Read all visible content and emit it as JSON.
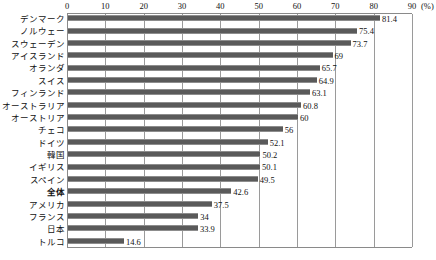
{
  "chart_data": {
    "type": "bar",
    "orientation": "horizontal",
    "title": "",
    "xlabel": "",
    "ylabel": "",
    "unit_label": "(%)",
    "xlim": [
      0,
      90
    ],
    "xticks": [
      0,
      10,
      20,
      30,
      40,
      50,
      60,
      70,
      80,
      90
    ],
    "xtick_labels": [
      "0",
      "10",
      "20",
      "30",
      "40",
      "50",
      "60",
      "70",
      "80",
      "90"
    ],
    "grid": true,
    "grid_axis": "x",
    "legend": false,
    "bar_color": "#5a5a5a",
    "categories": [
      "デンマーク",
      "ノルウェー",
      "スウェーデン",
      "アイスランド",
      "オランダ",
      "スイス",
      "フィンランド",
      "オーストラリア",
      "オーストリア",
      "チェコ",
      "ドイツ",
      "韓国",
      "イギリス",
      "スペイン",
      "全体",
      "アメリカ",
      "フランス",
      "日本",
      "トルコ"
    ],
    "values": [
      81.4,
      75.4,
      73.7,
      69,
      65.7,
      64.9,
      63.1,
      60.8,
      60,
      56,
      52.1,
      50.2,
      50.1,
      49.5,
      42.6,
      37.5,
      34,
      33.9,
      14.6
    ],
    "value_labels": [
      "81.4",
      "75.4",
      "73.7",
      "69",
      "65.7",
      "64.9",
      "63.1",
      "60.8",
      "60",
      "56",
      "52.1",
      "50.2",
      "50.1",
      "49.5",
      "42.6",
      "37.5",
      "34",
      "33.9",
      "14.6"
    ],
    "emphasized_categories": [
      "全体"
    ]
  }
}
